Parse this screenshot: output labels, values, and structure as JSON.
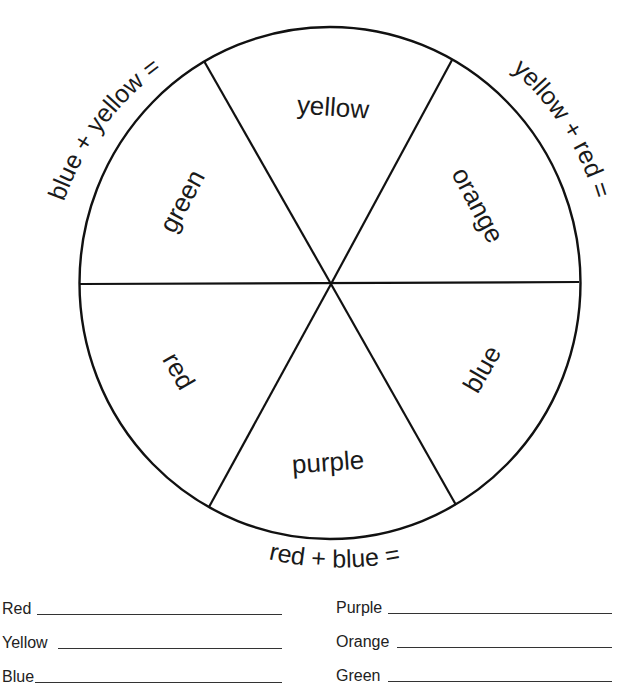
{
  "wheel": {
    "stroke_color": "#111111",
    "background": "#ffffff",
    "segments": [
      {
        "label": "yellow",
        "type": "primary"
      },
      {
        "label": "orange",
        "type": "secondary"
      },
      {
        "label": "blue",
        "type": "primary"
      },
      {
        "label": "purple",
        "type": "secondary"
      },
      {
        "label": "red",
        "type": "primary"
      },
      {
        "label": "green",
        "type": "secondary"
      }
    ],
    "equations": {
      "top_left": "blue + yellow =",
      "top_right": "yellow + red =",
      "bottom": "red + blue ="
    }
  },
  "answers": {
    "left": [
      {
        "label": "Red",
        "value": ""
      },
      {
        "label": "Yellow",
        "value": ""
      },
      {
        "label": "Blue",
        "value": ""
      }
    ],
    "right": [
      {
        "label": "Purple",
        "value": ""
      },
      {
        "label": "Orange",
        "value": ""
      },
      {
        "label": "Green",
        "value": ""
      }
    ]
  }
}
